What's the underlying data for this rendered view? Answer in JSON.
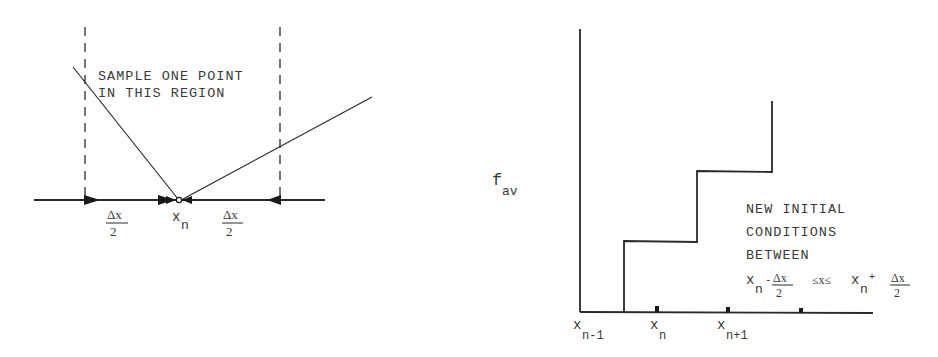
{
  "left_diagram": {
    "annotation_line1": "SAMPLE ONE POINT",
    "annotation_line2": "IN THIS REGION",
    "left_half_width": {
      "numerator": "Δx",
      "denominator": "2"
    },
    "center_label": {
      "base": "x",
      "sub": "n"
    },
    "right_half_width": {
      "numerator": "Δx",
      "denominator": "2"
    }
  },
  "right_diagram": {
    "y_axis_label": {
      "base": "f",
      "sub": "av"
    },
    "x_ticks": [
      {
        "base": "x",
        "sub": "n-1"
      },
      {
        "base": "x",
        "sub": "n"
      },
      {
        "base": "x",
        "sub": "n+1"
      }
    ],
    "annotation": {
      "line1": "NEW INITIAL",
      "line2": "CONDITIONS",
      "line3": "BETWEEN",
      "ineq_lower": {
        "base": "x",
        "sub": "n",
        "op": "-",
        "num": "Δx",
        "den": "2"
      },
      "ineq_mid": "≤x≤",
      "ineq_upper": {
        "base": "x",
        "sub": "n",
        "op": "+",
        "num": "Δx",
        "den": "2"
      }
    }
  }
}
